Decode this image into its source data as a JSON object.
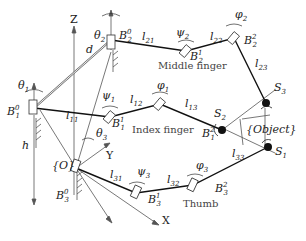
{
  "diagram": {
    "fingers": [
      {
        "name": "Middle finger",
        "base": "B2^0",
        "joint1": "B2^1",
        "joint2": "B2^2",
        "links": [
          "l21",
          "l22",
          "l23"
        ],
        "angles": [
          "θ2",
          "ψ2",
          "φ2"
        ],
        "contact": "S3"
      },
      {
        "name": "Index finger",
        "base": "B1^0",
        "joint1": "B1^1",
        "joint2": "B1^2",
        "links": [
          "l11",
          "l12",
          "l13"
        ],
        "angles": [
          "θ1",
          "ψ1",
          "φ1"
        ],
        "contact": "S2"
      },
      {
        "name": "Thumb",
        "base": "B3^0",
        "joint1": "B3^1",
        "joint2": "B3^2",
        "links": [
          "l31",
          "l32",
          "l33"
        ],
        "angles": [
          "θ3",
          "ψ3",
          "φ3"
        ],
        "contact": "S1"
      }
    ],
    "frame": {
      "origin": "{O}",
      "axes": [
        "X",
        "Y",
        "Z"
      ]
    },
    "dimensions": [
      "d",
      "h"
    ],
    "object_label": "{Object}",
    "labels": {
      "z_axis": "Z",
      "y_axis": "Y",
      "x_axis": "X",
      "origin": "{O}",
      "object": "{Object}",
      "d": "d",
      "h": "h",
      "theta1": "θ",
      "theta1_sub": "1",
      "theta2": "θ",
      "theta2_sub": "2",
      "theta3": "θ",
      "theta3_sub": "3",
      "psi1": "ψ",
      "psi1_sub": "1",
      "psi2": "ψ",
      "psi2_sub": "2",
      "psi3": "ψ",
      "psi3_sub": "3",
      "phi1": "φ",
      "phi1_sub": "1",
      "phi2": "φ",
      "phi2_sub": "2",
      "phi3": "φ",
      "phi3_sub": "3",
      "B": "B",
      "l": "l",
      "S": "S",
      "middle_finger": "Middle finger",
      "index_finger": "Index finger",
      "thumb": "Thumb",
      "n0": "0",
      "n1": "1",
      "n2": "2",
      "n3": "3",
      "n11": "11",
      "n12": "12",
      "n13": "13",
      "n21": "21",
      "n22": "22",
      "n23": "23",
      "n31": "31",
      "n32": "32",
      "n33": "33"
    }
  }
}
